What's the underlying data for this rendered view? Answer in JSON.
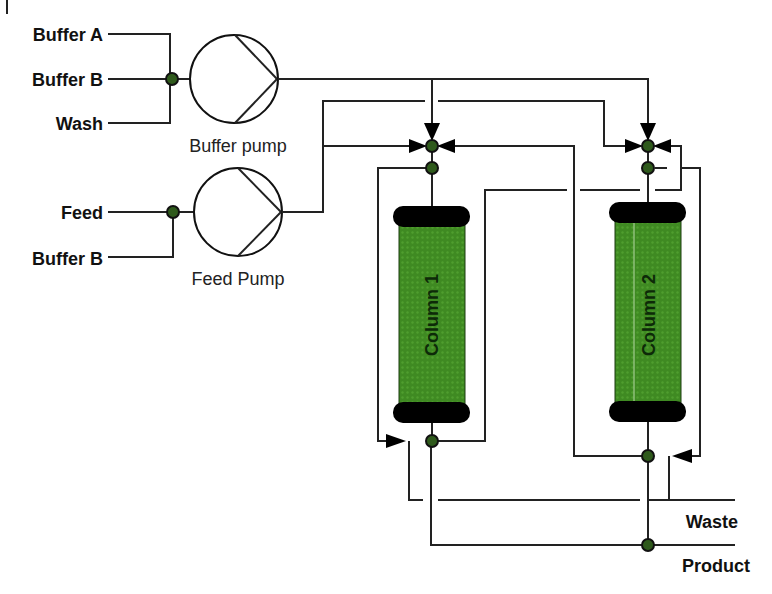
{
  "inputs": {
    "buffer_pump": [
      "Buffer A",
      "Buffer B",
      "Wash"
    ],
    "feed_pump": [
      "Feed",
      "Buffer B"
    ]
  },
  "pumps": {
    "buffer": "Buffer pump",
    "feed": "Feed Pump"
  },
  "columns": [
    "Column 1",
    "Column 2"
  ],
  "outputs": {
    "waste": "Waste",
    "product": "Product"
  },
  "colors": {
    "column_fill": "#3f8a22",
    "node_fill": "#2f5a1c",
    "line": "#222222"
  }
}
